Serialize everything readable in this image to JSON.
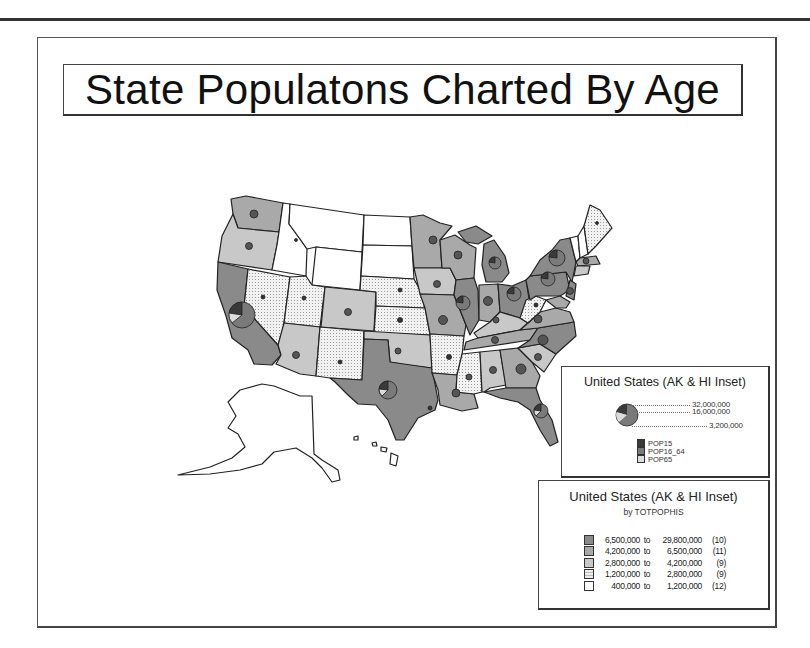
{
  "title": "State Populatons Charted By Age",
  "map": {
    "name": "United States (AK & HI Inset)",
    "class_fills": {
      "c1": "#8a8a8a",
      "c2": "#a9a9a9",
      "c3": "#c8c8c8",
      "c4": "#ececec",
      "c5": "#ffffff"
    },
    "pie_colors": {
      "POP15": "#3a3a3a",
      "POP16_64": "#7a7a7a",
      "POP65": "#dcdcdc"
    }
  },
  "pie_legend": {
    "title": "United States (AK & HI Inset)",
    "scale_labels": [
      "32,000,000",
      "16,000,000",
      "3,200,000"
    ],
    "series": [
      {
        "label": "POP15",
        "color": "#3a3a3a"
      },
      {
        "label": "POP16_64",
        "color": "#7a7a7a"
      },
      {
        "label": "POP65",
        "color": "#dcdcdc"
      }
    ]
  },
  "class_legend": {
    "title": "United States (AK & HI Inset)",
    "subtitle": "by TOTPOPHIS",
    "classes": [
      {
        "from": "6,500,000",
        "to_word": "to",
        "to": "29,800,000",
        "count": "(10)",
        "color": "#8a8a8a"
      },
      {
        "from": "4,200,000",
        "to_word": "to",
        "to": "6,500,000",
        "count": "(11)",
        "color": "#a9a9a9"
      },
      {
        "from": "2,800,000",
        "to_word": "to",
        "to": "4,200,000",
        "count": "(9)",
        "color": "#c8c8c8"
      },
      {
        "from": "1,200,000",
        "to_word": "to",
        "to": "2,800,000",
        "count": "(9)",
        "color": "#ececec"
      },
      {
        "from": "400,000",
        "to_word": "to",
        "to": "1,200,000",
        "count": "(12)",
        "color": "#ffffff"
      }
    ]
  }
}
